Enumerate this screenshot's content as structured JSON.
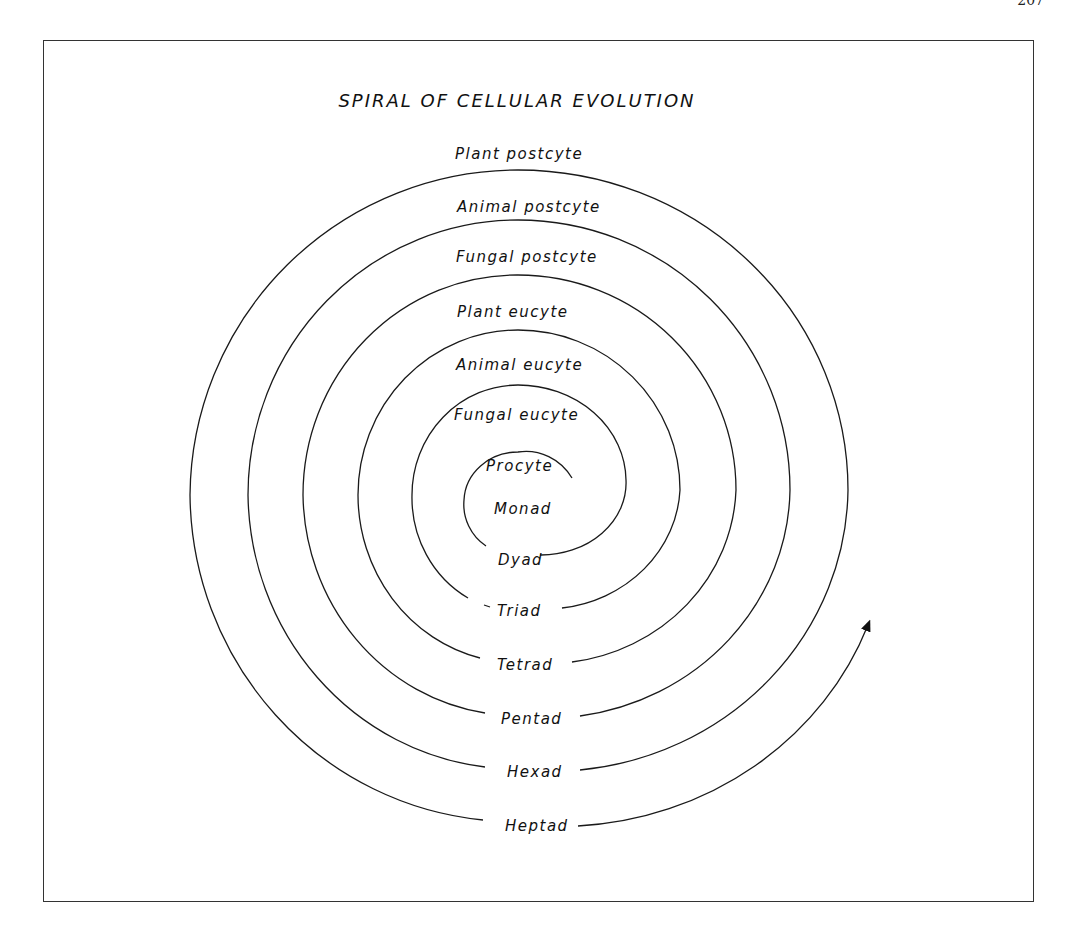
{
  "page": {
    "number": "207"
  },
  "diagram": {
    "title": "SPIRAL OF CELLULAR EVOLUTION",
    "top_labels": [
      "Plant postcyte",
      "Animal postcyte",
      "Fungal postcyte",
      "Plant eucyte",
      "Animal eucyte",
      "Fungal eucyte",
      "Procyte"
    ],
    "center_label": "Monad",
    "bottom_labels": [
      "Dyad",
      "Triad",
      "Tetrad",
      "Pentad",
      "Hexad",
      "Heptad"
    ],
    "arrow": "arrow-up-right"
  }
}
